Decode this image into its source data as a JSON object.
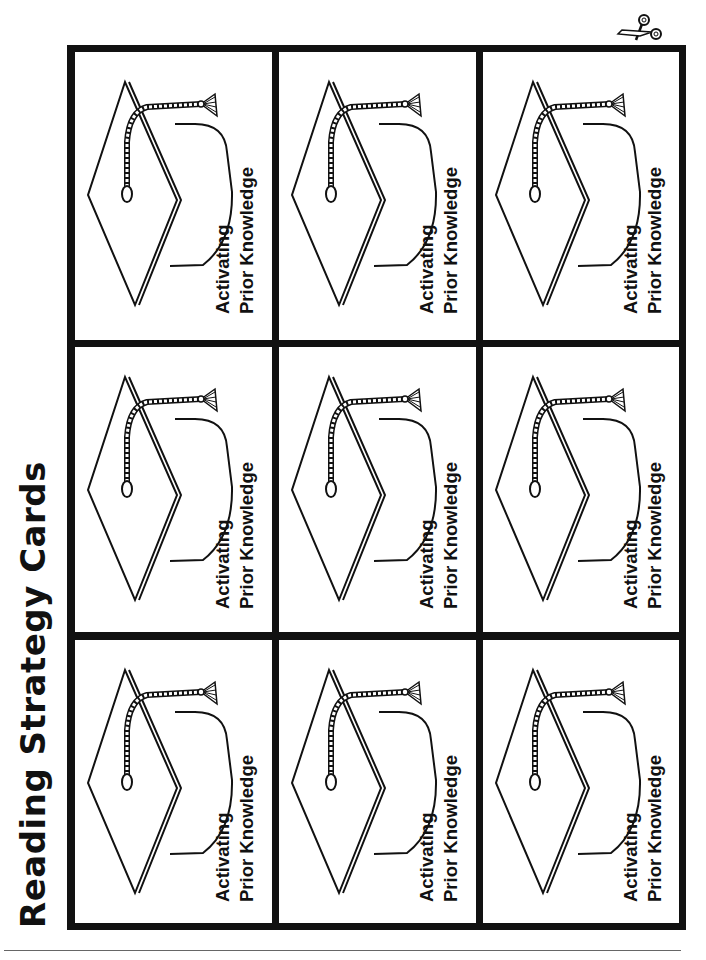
{
  "page": {
    "title": "Reading Strategy Cards",
    "cut_icon": "scissors-icon"
  },
  "grid": {
    "rows": 3,
    "columns": 3,
    "cards": [
      {
        "line1": "Activating",
        "line2": "Prior Knowledge",
        "icon": "graduation-cap-icon"
      },
      {
        "line1": "Activating",
        "line2": "Prior Knowledge",
        "icon": "graduation-cap-icon"
      },
      {
        "line1": "Activating",
        "line2": "Prior Knowledge",
        "icon": "graduation-cap-icon"
      },
      {
        "line1": "Activating",
        "line2": "Prior Knowledge",
        "icon": "graduation-cap-icon"
      },
      {
        "line1": "Activating",
        "line2": "Prior Knowledge",
        "icon": "graduation-cap-icon"
      },
      {
        "line1": "Activating",
        "line2": "Prior Knowledge",
        "icon": "graduation-cap-icon"
      },
      {
        "line1": "Activating",
        "line2": "Prior Knowledge",
        "icon": "graduation-cap-icon"
      },
      {
        "line1": "Activating",
        "line2": "Prior Knowledge",
        "icon": "graduation-cap-icon"
      },
      {
        "line1": "Activating",
        "line2": "Prior Knowledge",
        "icon": "graduation-cap-icon"
      }
    ]
  },
  "colors": {
    "ink": "#111111",
    "paper": "#ffffff",
    "rule": "#666666"
  }
}
